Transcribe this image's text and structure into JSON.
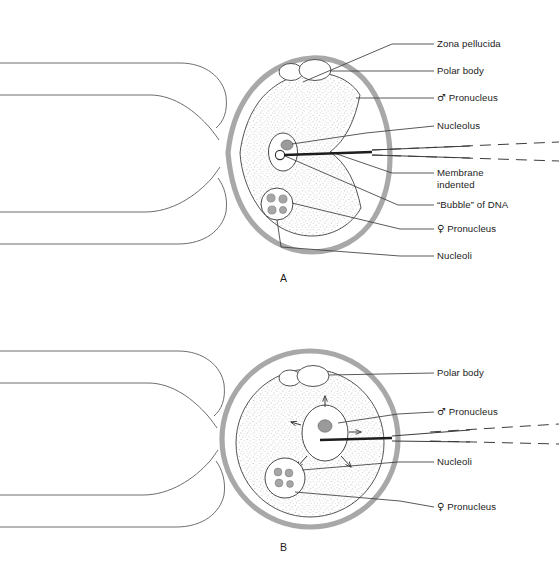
{
  "figure": {
    "title_faint": "",
    "panels": [
      {
        "id": "A",
        "letter": "A",
        "labels": [
          {
            "key": "zona_pellucida",
            "text": "Zona pellucida"
          },
          {
            "key": "polar_body",
            "text": "Polar body"
          },
          {
            "key": "male_pronucleus",
            "symbol": "♂",
            "text": " Pronucleus"
          },
          {
            "key": "nucleolus",
            "text": "Nucleolus"
          },
          {
            "key": "membrane_line1",
            "text": "Membrane"
          },
          {
            "key": "membrane_line2",
            "text": "indented"
          },
          {
            "key": "bubble_of_dna",
            "text": "“Bubble” of DNA"
          },
          {
            "key": "female_pronucleus",
            "symbol": "♀",
            "text": " Pronucleus"
          },
          {
            "key": "nucleoli",
            "text": "Nucleoli"
          }
        ]
      },
      {
        "id": "B",
        "letter": "B",
        "labels": [
          {
            "key": "polar_body",
            "text": "Polar body"
          },
          {
            "key": "male_pronucleus",
            "symbol": "♂",
            "text": " Pronucleus"
          },
          {
            "key": "nucleoli",
            "text": "Nucleoli"
          },
          {
            "key": "female_pronucleus",
            "symbol": "♀",
            "text": " Pronucleus"
          }
        ]
      }
    ]
  },
  "colors": {
    "zona": "#a8a8a8",
    "outline": "#4a4a4a",
    "stipple": "#b9b9bd",
    "nucleolus_fill": "#9a9a9a",
    "leader": "#3c3c3c",
    "text": "#1b1b1b",
    "background": "#ffffff"
  }
}
